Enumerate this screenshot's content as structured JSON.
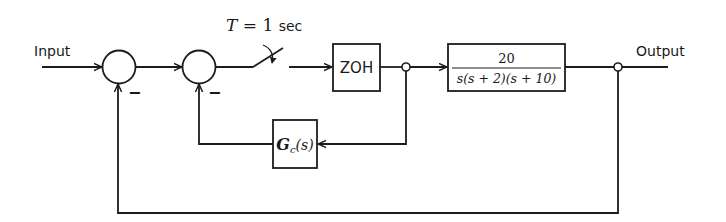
{
  "diagram": {
    "type": "block-diagram",
    "input_label": "Input",
    "output_label": "Output",
    "sampler": {
      "label_var": "T",
      "label_eq": " = 1 ",
      "label_unit": "sec"
    },
    "summing_junctions": [
      {
        "id": "sum1",
        "sign_feedback": "−"
      },
      {
        "id": "sum2",
        "sign_feedback": "−"
      }
    ],
    "blocks": {
      "zoh": {
        "label": "ZOH"
      },
      "plant": {
        "numerator": "20",
        "denominator": "s(s + 2)(s + 10)"
      },
      "compensator": {
        "label_main": "G",
        "label_sub": "c",
        "label_arg": "(s)"
      }
    },
    "colors": {
      "line": "#1c1c1c",
      "background": "#ffffff"
    }
  }
}
